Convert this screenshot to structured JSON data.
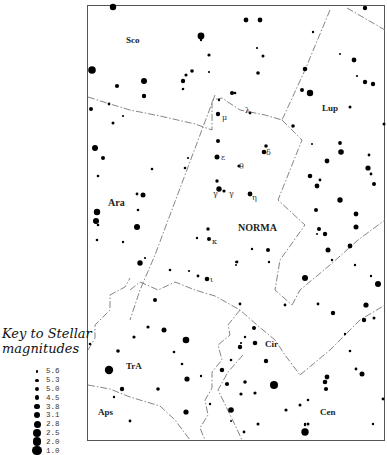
{
  "map": {
    "title": "Norma",
    "constellation_labels": [
      {
        "text": "Sco",
        "x": 126,
        "y": 43,
        "size": 9,
        "bold": true
      },
      {
        "text": "Lup",
        "x": 322,
        "y": 111,
        "size": 9,
        "bold": true
      },
      {
        "text": "Ara",
        "x": 108,
        "y": 206,
        "size": 10,
        "bold": true
      },
      {
        "text": "NORMA",
        "x": 238,
        "y": 231,
        "size": 10,
        "bold": true
      },
      {
        "text": "Cir",
        "x": 265,
        "y": 347,
        "size": 9,
        "bold": true
      },
      {
        "text": "TrA",
        "x": 126,
        "y": 369,
        "size": 9,
        "bold": true
      },
      {
        "text": "Aps",
        "x": 98,
        "y": 415,
        "size": 9,
        "bold": true
      },
      {
        "text": "Cen",
        "x": 320,
        "y": 415,
        "size": 9,
        "bold": true
      }
    ],
    "greek_labels": [
      {
        "text": "μ",
        "x": 222,
        "y": 120
      },
      {
        "text": "λ",
        "x": 245,
        "y": 113
      },
      {
        "text": "ε",
        "x": 221,
        "y": 160
      },
      {
        "text": "θ",
        "x": 239,
        "y": 169
      },
      {
        "text": "δ",
        "x": 266,
        "y": 155
      },
      {
        "text": "γ",
        "x": 213,
        "y": 196
      },
      {
        "text": "γ",
        "x": 229,
        "y": 196
      },
      {
        "text": "η",
        "x": 252,
        "y": 200
      },
      {
        "text": "κ",
        "x": 212,
        "y": 244
      },
      {
        "text": "ι",
        "x": 210,
        "y": 282
      }
    ],
    "boundaries": [
      "M88,97 L110,104 L130,110 L160,116 L195,124 L212,130 L212,100 L222,98 L240,110 L265,115 L282,120",
      "M215,95 L200,135 L185,175 L170,215 L155,255 L140,290 L130,320",
      "M330,10 L305,70 L282,120",
      "M347,8 L385,30",
      "M282,120 L302,140 L278,200 L305,225 L280,260 L275,290 L292,305",
      "M292,305 L300,290 L330,265 L358,240 L385,220",
      "M130,290 L140,282 L158,290 L175,282 L195,290 L215,296 L240,310 L257,325 L275,340 L285,355 L300,375",
      "M88,350 L95,338 L95,325 L110,310 L110,295 L125,287 L130,278",
      "M88,385 L110,389 L130,397 L160,406 L175,420 L190,440",
      "M240,310 L228,325 L230,335 L218,345 L222,360 L212,372 L212,388 L205,400 L208,415 L200,428 L205,440",
      "M300,375 L330,350 L360,320 L385,305",
      "M243,355 L228,372 L218,390 L235,425 L242,440"
    ],
    "stars": [
      {
        "x": 113,
        "y": 7,
        "r": 3.2
      },
      {
        "x": 201,
        "y": 40,
        "r": 1.2
      },
      {
        "x": 92,
        "y": 70,
        "r": 3.8
      },
      {
        "x": 201,
        "y": 36,
        "r": 3.4
      },
      {
        "x": 209,
        "y": 55,
        "r": 1.6
      },
      {
        "x": 209,
        "y": 72,
        "r": 1.1
      },
      {
        "x": 192,
        "y": 71,
        "r": 1.8
      },
      {
        "x": 186,
        "y": 75,
        "r": 1.6
      },
      {
        "x": 183,
        "y": 81,
        "r": 2.2
      },
      {
        "x": 183,
        "y": 89,
        "r": 1.3
      },
      {
        "x": 144,
        "y": 81,
        "r": 3.0
      },
      {
        "x": 144,
        "y": 96,
        "r": 2.2
      },
      {
        "x": 117,
        "y": 86,
        "r": 2.1
      },
      {
        "x": 91,
        "y": 109,
        "r": 2.0
      },
      {
        "x": 109,
        "y": 104,
        "r": 1.4
      },
      {
        "x": 123,
        "y": 116,
        "r": 1.1
      },
      {
        "x": 113,
        "y": 123,
        "r": 1.5
      },
      {
        "x": 232,
        "y": 93,
        "r": 2.0
      },
      {
        "x": 219,
        "y": 100,
        "r": 1.2
      },
      {
        "x": 218,
        "y": 114,
        "r": 2.2
      },
      {
        "x": 246,
        "y": 20,
        "r": 2.4
      },
      {
        "x": 260,
        "y": 20,
        "r": 2.4
      },
      {
        "x": 257,
        "y": 48,
        "r": 1.1
      },
      {
        "x": 263,
        "y": 56,
        "r": 1.5
      },
      {
        "x": 258,
        "y": 73,
        "r": 1.8
      },
      {
        "x": 313,
        "y": 32,
        "r": 1.2
      },
      {
        "x": 305,
        "y": 69,
        "r": 2.3
      },
      {
        "x": 302,
        "y": 90,
        "r": 2.0
      },
      {
        "x": 310,
        "y": 93,
        "r": 3.2
      },
      {
        "x": 235,
        "y": 93,
        "r": 1.3
      },
      {
        "x": 340,
        "y": 54,
        "r": 1.0
      },
      {
        "x": 354,
        "y": 60,
        "r": 2.4
      },
      {
        "x": 357,
        "y": 76,
        "r": 1.1
      },
      {
        "x": 365,
        "y": 82,
        "r": 2.2
      },
      {
        "x": 373,
        "y": 84,
        "r": 2.2
      },
      {
        "x": 350,
        "y": 107,
        "r": 1.5
      },
      {
        "x": 365,
        "y": 8,
        "r": 2.2
      },
      {
        "x": 384,
        "y": 124,
        "r": 1.5
      },
      {
        "x": 293,
        "y": 126,
        "r": 1.8
      },
      {
        "x": 250,
        "y": 113,
        "r": 1.4
      },
      {
        "x": 95,
        "y": 148,
        "r": 3.0
      },
      {
        "x": 103,
        "y": 158,
        "r": 2.0
      },
      {
        "x": 98,
        "y": 176,
        "r": 1.3
      },
      {
        "x": 152,
        "y": 169,
        "r": 1.3
      },
      {
        "x": 188,
        "y": 158,
        "r": 1.1
      },
      {
        "x": 185,
        "y": 168,
        "r": 1.3
      },
      {
        "x": 218,
        "y": 141,
        "r": 2.0
      },
      {
        "x": 217,
        "y": 157,
        "r": 2.5
      },
      {
        "x": 217,
        "y": 181,
        "r": 1.7
      },
      {
        "x": 219,
        "y": 189,
        "r": 2.7
      },
      {
        "x": 224,
        "y": 191,
        "r": 1.6
      },
      {
        "x": 239,
        "y": 166,
        "r": 1.6
      },
      {
        "x": 264,
        "y": 152,
        "r": 2.3
      },
      {
        "x": 250,
        "y": 194,
        "r": 2.4
      },
      {
        "x": 137,
        "y": 194,
        "r": 1.4
      },
      {
        "x": 143,
        "y": 195,
        "r": 2.5
      },
      {
        "x": 97,
        "y": 212,
        "r": 3.2
      },
      {
        "x": 96,
        "y": 221,
        "r": 3.0
      },
      {
        "x": 98,
        "y": 225,
        "r": 1.3
      },
      {
        "x": 138,
        "y": 210,
        "r": 1.3
      },
      {
        "x": 137,
        "y": 227,
        "r": 3.0
      },
      {
        "x": 97,
        "y": 240,
        "r": 1.3
      },
      {
        "x": 123,
        "y": 242,
        "r": 1.2
      },
      {
        "x": 140,
        "y": 263,
        "r": 2.7
      },
      {
        "x": 145,
        "y": 258,
        "r": 1.1
      },
      {
        "x": 208,
        "y": 229,
        "r": 1.7
      },
      {
        "x": 197,
        "y": 238,
        "r": 1.2
      },
      {
        "x": 209,
        "y": 239,
        "r": 2.0
      },
      {
        "x": 170,
        "y": 270,
        "r": 1.3
      },
      {
        "x": 189,
        "y": 271,
        "r": 1.1
      },
      {
        "x": 198,
        "y": 276,
        "r": 1.4
      },
      {
        "x": 207,
        "y": 279,
        "r": 2.3
      },
      {
        "x": 268,
        "y": 250,
        "r": 2.0
      },
      {
        "x": 269,
        "y": 262,
        "r": 1.2
      },
      {
        "x": 237,
        "y": 262,
        "r": 1.4
      },
      {
        "x": 236,
        "y": 265,
        "r": 1.0
      },
      {
        "x": 266,
        "y": 146,
        "r": 1.8
      },
      {
        "x": 312,
        "y": 144,
        "r": 1.0
      },
      {
        "x": 340,
        "y": 143,
        "r": 1.9
      },
      {
        "x": 341,
        "y": 152,
        "r": 2.8
      },
      {
        "x": 327,
        "y": 161,
        "r": 2.4
      },
      {
        "x": 369,
        "y": 155,
        "r": 1.4
      },
      {
        "x": 368,
        "y": 168,
        "r": 2.6
      },
      {
        "x": 371,
        "y": 174,
        "r": 1.4
      },
      {
        "x": 374,
        "y": 184,
        "r": 2.0
      },
      {
        "x": 310,
        "y": 176,
        "r": 2.3
      },
      {
        "x": 320,
        "y": 180,
        "r": 1.4
      },
      {
        "x": 317,
        "y": 186,
        "r": 2.4
      },
      {
        "x": 340,
        "y": 200,
        "r": 2.7
      },
      {
        "x": 316,
        "y": 210,
        "r": 2.0
      },
      {
        "x": 356,
        "y": 214,
        "r": 2.4
      },
      {
        "x": 356,
        "y": 227,
        "r": 2.5
      },
      {
        "x": 319,
        "y": 229,
        "r": 2.0
      },
      {
        "x": 317,
        "y": 234,
        "r": 1.0
      },
      {
        "x": 325,
        "y": 234,
        "r": 2.2
      },
      {
        "x": 350,
        "y": 246,
        "r": 2.4
      },
      {
        "x": 328,
        "y": 250,
        "r": 2.5
      },
      {
        "x": 332,
        "y": 260,
        "r": 1.2
      },
      {
        "x": 355,
        "y": 265,
        "r": 1.2
      },
      {
        "x": 305,
        "y": 278,
        "r": 3.0
      },
      {
        "x": 371,
        "y": 276,
        "r": 1.2
      },
      {
        "x": 378,
        "y": 284,
        "r": 3.0
      },
      {
        "x": 252,
        "y": 249,
        "r": 1.2
      },
      {
        "x": 236,
        "y": 262,
        "r": 1.1
      },
      {
        "x": 318,
        "y": 304,
        "r": 1.4
      },
      {
        "x": 366,
        "y": 305,
        "r": 2.6
      },
      {
        "x": 333,
        "y": 313,
        "r": 2.2
      },
      {
        "x": 364,
        "y": 320,
        "r": 2.2
      },
      {
        "x": 374,
        "y": 318,
        "r": 1.5
      },
      {
        "x": 345,
        "y": 334,
        "r": 1.2
      },
      {
        "x": 350,
        "y": 351,
        "r": 1.3
      },
      {
        "x": 356,
        "y": 369,
        "r": 1.4
      },
      {
        "x": 362,
        "y": 374,
        "r": 2.5
      },
      {
        "x": 383,
        "y": 399,
        "r": 1.4
      },
      {
        "x": 327,
        "y": 377,
        "r": 2.4
      },
      {
        "x": 326,
        "y": 389,
        "r": 2.1
      },
      {
        "x": 308,
        "y": 400,
        "r": 1.3
      },
      {
        "x": 308,
        "y": 424,
        "r": 1.5
      },
      {
        "x": 373,
        "y": 424,
        "r": 1.2
      },
      {
        "x": 305,
        "y": 424,
        "r": 1.2
      },
      {
        "x": 285,
        "y": 305,
        "r": 1.4
      },
      {
        "x": 255,
        "y": 343,
        "r": 2.3
      },
      {
        "x": 254,
        "y": 328,
        "r": 2.0
      },
      {
        "x": 245,
        "y": 337,
        "r": 1.2
      },
      {
        "x": 241,
        "y": 343,
        "r": 1.1
      },
      {
        "x": 240,
        "y": 347,
        "r": 2.2
      },
      {
        "x": 266,
        "y": 361,
        "r": 2.2
      },
      {
        "x": 245,
        "y": 382,
        "r": 1.8
      },
      {
        "x": 274,
        "y": 385,
        "r": 4.0
      },
      {
        "x": 255,
        "y": 393,
        "r": 1.6
      },
      {
        "x": 241,
        "y": 394,
        "r": 1.6
      },
      {
        "x": 231,
        "y": 410,
        "r": 2.8
      },
      {
        "x": 244,
        "y": 432,
        "r": 1.4
      },
      {
        "x": 286,
        "y": 410,
        "r": 1.6
      },
      {
        "x": 300,
        "y": 405,
        "r": 1.5
      },
      {
        "x": 325,
        "y": 382,
        "r": 2.3
      },
      {
        "x": 258,
        "y": 424,
        "r": 1.5
      },
      {
        "x": 305,
        "y": 425,
        "r": 1.2
      },
      {
        "x": 231,
        "y": 421,
        "r": 1.0
      },
      {
        "x": 305,
        "y": 432,
        "r": 3.7
      },
      {
        "x": 155,
        "y": 300,
        "r": 2.0
      },
      {
        "x": 148,
        "y": 327,
        "r": 1.6
      },
      {
        "x": 164,
        "y": 330,
        "r": 2.5
      },
      {
        "x": 134,
        "y": 337,
        "r": 1.6
      },
      {
        "x": 186,
        "y": 340,
        "r": 3.3
      },
      {
        "x": 90,
        "y": 344,
        "r": 1.3
      },
      {
        "x": 118,
        "y": 351,
        "r": 1.8
      },
      {
        "x": 174,
        "y": 352,
        "r": 1.3
      },
      {
        "x": 182,
        "y": 364,
        "r": 1.3
      },
      {
        "x": 109,
        "y": 370,
        "r": 4.2
      },
      {
        "x": 187,
        "y": 379,
        "r": 2.6
      },
      {
        "x": 122,
        "y": 389,
        "r": 2.2
      },
      {
        "x": 158,
        "y": 389,
        "r": 1.8
      },
      {
        "x": 114,
        "y": 397,
        "r": 1.2
      },
      {
        "x": 186,
        "y": 412,
        "r": 2.6
      },
      {
        "x": 130,
        "y": 421,
        "r": 1.4
      },
      {
        "x": 221,
        "y": 370,
        "r": 1.3
      },
      {
        "x": 222,
        "y": 370,
        "r": 2.2
      },
      {
        "x": 227,
        "y": 384,
        "r": 2.1
      },
      {
        "x": 201,
        "y": 376,
        "r": 1.2
      },
      {
        "x": 210,
        "y": 404,
        "r": 1.2
      },
      {
        "x": 240,
        "y": 304,
        "r": 1.4
      },
      {
        "x": 231,
        "y": 360,
        "r": 1.3
      }
    ]
  },
  "key": {
    "title_line1": "Key to Stellar",
    "title_line2": "magnitudes",
    "entries": [
      {
        "label": "5.6",
        "size": 2.6
      },
      {
        "label": "5.3",
        "size": 3.2
      },
      {
        "label": "5.0",
        "size": 3.8
      },
      {
        "label": "4.5",
        "size": 4.6
      },
      {
        "label": "3.8",
        "size": 5.4
      },
      {
        "label": "3.1",
        "size": 6.2
      },
      {
        "label": "2.8",
        "size": 7.0
      },
      {
        "label": "2.5",
        "size": 7.8
      },
      {
        "label": "2.0",
        "size": 8.6
      },
      {
        "label": "1.0",
        "size": 9.6
      }
    ]
  },
  "colors": {
    "star": "#000000",
    "border": "#444444",
    "boundary": "#777777",
    "background": "#ffffff"
  }
}
